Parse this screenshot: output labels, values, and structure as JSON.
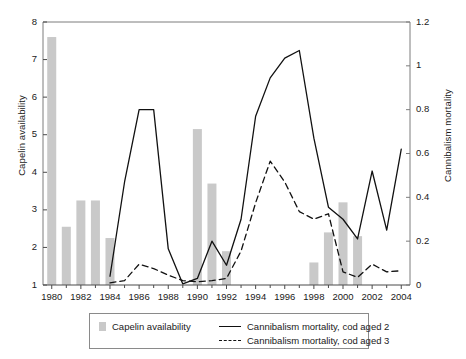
{
  "chart_data": {
    "type": "bar",
    "title": "",
    "xlabel": "",
    "ylabel": "Capelin availability",
    "ylabel_right": "Cannibalism mortality",
    "grid": false,
    "legend_position": "bottom",
    "x": [
      1980,
      1981,
      1982,
      1983,
      1984,
      1985,
      1986,
      1987,
      1988,
      1989,
      1990,
      1991,
      1992,
      1993,
      1994,
      1995,
      1996,
      1997,
      1998,
      1999,
      2000,
      2001,
      2002,
      2003,
      2004
    ],
    "xlim": [
      1979.4,
      2004.6
    ],
    "ylim": [
      1,
      8
    ],
    "ylim_right": [
      0,
      1.2
    ],
    "xticks": [
      1980,
      1982,
      1984,
      1986,
      1988,
      1990,
      1992,
      1994,
      1996,
      1998,
      2000,
      2002,
      2004
    ],
    "xtick_labels": [
      "1980",
      "1982",
      "1984",
      "1986",
      "1988",
      "1990",
      "1992",
      "1994",
      "1996",
      "1998",
      "2000",
      "2002",
      "2004"
    ],
    "xticks_minor": [
      1981,
      1983,
      1985,
      1987,
      1989,
      1991,
      1993,
      1995,
      1997,
      1999,
      2001,
      2003
    ],
    "yticks_left": [
      1,
      2,
      3,
      4,
      5,
      6,
      7,
      8
    ],
    "ytick_labels_left": [
      "1",
      "2",
      "3",
      "4",
      "5",
      "6",
      "7",
      "8"
    ],
    "yticks_right": [
      0,
      0.2,
      0.4,
      0.6,
      0.8,
      1,
      1.2
    ],
    "ytick_labels_right": [
      "0",
      "0.2",
      "0.4",
      "0.6",
      "0.8",
      "1",
      "1.2"
    ],
    "bar_color": "#c9c9c9",
    "line_color": "#111111",
    "series": [
      {
        "name": "Capelin availability",
        "type": "bar",
        "axis": "left",
        "color": "#c9c9c9",
        "values": [
          7.6,
          2.55,
          3.25,
          3.25,
          2.25,
          null,
          null,
          null,
          null,
          null,
          5.15,
          3.7,
          1.9,
          null,
          null,
          null,
          null,
          null,
          1.6,
          2.4,
          3.2,
          2.3,
          null,
          null,
          null
        ]
      },
      {
        "name": "Cannibalism mortality, cod aged 2",
        "type": "line",
        "style": "solid",
        "axis": "right",
        "color": "#111111",
        "values": [
          null,
          null,
          null,
          null,
          0.04,
          0.47,
          0.8,
          0.8,
          0.165,
          0.005,
          0.03,
          0.2,
          0.09,
          0.3,
          0.77,
          0.945,
          1.035,
          1.07,
          0.67,
          0.355,
          0.3,
          0.21,
          0.52,
          0.25,
          0.62
        ]
      },
      {
        "name": "Cannibalism mortality, cod aged 3",
        "type": "line",
        "style": "dashed",
        "axis": "right",
        "color": "#111111",
        "values": [
          null,
          null,
          null,
          null,
          0.01,
          0.02,
          0.095,
          0.075,
          0.045,
          0.02,
          0.015,
          0.02,
          0.03,
          0.155,
          0.375,
          0.565,
          0.47,
          0.335,
          0.3,
          0.325,
          0.06,
          0.035,
          0.095,
          0.06,
          0.065
        ]
      }
    ],
    "legend": [
      {
        "label": "Capelin availability",
        "marker": "bar-swatch",
        "color": "#c9c9c9"
      },
      {
        "label": "Cannibalism mortality, cod aged 2",
        "marker": "solid-line",
        "color": "#111111"
      },
      {
        "label": "Cannibalism mortality, cod aged 3",
        "marker": "dashed-line",
        "color": "#111111"
      }
    ]
  }
}
